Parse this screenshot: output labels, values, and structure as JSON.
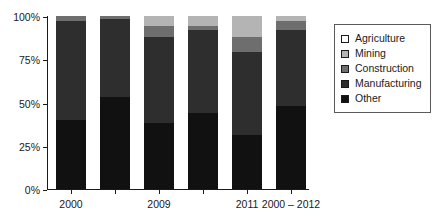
{
  "chart_data": {
    "type": "bar",
    "variant": "stacked-percent",
    "title": "",
    "subtitle": "",
    "xlabel": "",
    "ylabel": "",
    "ylim": [
      0,
      100
    ],
    "yticks": [
      "0%",
      "25%",
      "50%",
      "75%",
      "100%"
    ],
    "ytick_values": [
      0,
      25,
      50,
      75,
      100
    ],
    "grid": false,
    "legend_position": "right",
    "categories": [
      "2000",
      "",
      "2009",
      "",
      "2011",
      "2000 – 2012"
    ],
    "xtick_labels": [
      "2000",
      "2009",
      "2011",
      "2000 – 2012"
    ],
    "series": [
      {
        "name": "Other",
        "color": "#111111",
        "values": [
          40,
          53,
          38,
          44,
          31,
          48
        ]
      },
      {
        "name": "Manufacturing",
        "color": "#2e2e2e",
        "values": [
          57,
          45,
          50,
          48,
          48,
          44
        ]
      },
      {
        "name": "Construction",
        "color": "#6e6e6e",
        "values": [
          3,
          2,
          6,
          2,
          9,
          5
        ]
      },
      {
        "name": "Mining",
        "color": "#b4b4b4",
        "values": [
          0,
          0,
          6,
          6,
          12,
          3
        ]
      },
      {
        "name": "Agriculture",
        "color": "#ffffff",
        "values": [
          0,
          0,
          0,
          0,
          0,
          0
        ]
      }
    ],
    "stack_order_bottom_to_top": [
      "Other",
      "Manufacturing",
      "Construction",
      "Mining",
      "Agriculture"
    ]
  },
  "legend": {
    "items": [
      {
        "label": "Agriculture",
        "color": "#ffffff"
      },
      {
        "label": "Mining",
        "color": "#b4b4b4"
      },
      {
        "label": "Construction",
        "color": "#6e6e6e"
      },
      {
        "label": "Manufacturing",
        "color": "#2e2e2e"
      },
      {
        "label": "Other",
        "color": "#111111"
      }
    ]
  }
}
